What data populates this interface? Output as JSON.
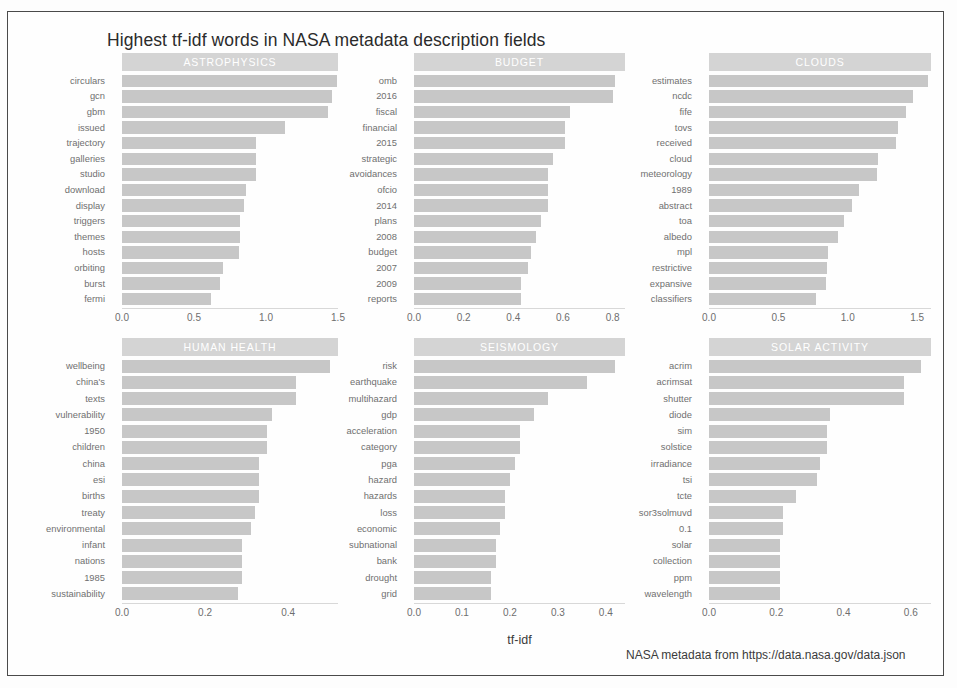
{
  "figure": {
    "title": "Highest tf-idf words in NASA metadata description fields",
    "xlabel": "tf-idf",
    "caption": "NASA metadata from https://data.nasa.gov/data.json"
  },
  "style": {
    "bar_color": "#c7c7c7",
    "strip_color": "#d4d4d4",
    "strip_text_color": "#ffffff",
    "axis_text_color": "#6e6e6e",
    "border_color": "#4a4a4a"
  },
  "chart_data": {
    "type": "bar",
    "title": "Highest tf-idf words in NASA metadata description fields",
    "xlabel": "tf-idf",
    "ylabel": "",
    "orientation": "horizontal",
    "grid": false,
    "legend": "none",
    "facets": [
      {
        "name": "ASTROPHYSICS",
        "xlim": [
          0.0,
          1.5
        ],
        "ticks": [
          "0.0",
          "0.5",
          "1.0",
          "1.5"
        ],
        "tick_values": [
          0.0,
          0.5,
          1.0,
          1.5
        ],
        "categories": [
          "circulars",
          "gcn",
          "gbm",
          "issued",
          "trajectory",
          "galleries",
          "studio",
          "download",
          "display",
          "triggers",
          "themes",
          "hosts",
          "orbiting",
          "burst",
          "fermi"
        ],
        "values": [
          1.49,
          1.46,
          1.43,
          1.13,
          0.93,
          0.93,
          0.93,
          0.86,
          0.85,
          0.82,
          0.82,
          0.81,
          0.7,
          0.68,
          0.62
        ]
      },
      {
        "name": "BUDGET",
        "xlim": [
          0.0,
          0.85
        ],
        "ticks": [
          "0.0",
          "0.2",
          "0.4",
          "0.6",
          "0.8"
        ],
        "tick_values": [
          0.0,
          0.2,
          0.4,
          0.6,
          0.8
        ],
        "categories": [
          "omb",
          "2016",
          "fiscal",
          "financial",
          "2015",
          "strategic",
          "avoidances",
          "ofcio",
          "2014",
          "plans",
          "2008",
          "budget",
          "2007",
          "2009",
          "reports"
        ],
        "values": [
          0.81,
          0.8,
          0.63,
          0.61,
          0.61,
          0.56,
          0.54,
          0.54,
          0.54,
          0.51,
          0.49,
          0.47,
          0.46,
          0.43,
          0.43
        ]
      },
      {
        "name": "CLOUDS",
        "xlim": [
          0.0,
          1.6
        ],
        "ticks": [
          "0.0",
          "0.5",
          "1.0",
          "1.5"
        ],
        "tick_values": [
          0.0,
          0.5,
          1.0,
          1.5
        ],
        "categories": [
          "estimates",
          "ncdc",
          "fife",
          "tovs",
          "received",
          "cloud",
          "meteorology",
          "1989",
          "abstract",
          "toa",
          "albedo",
          "mpl",
          "restrictive",
          "expansive",
          "classifiers"
        ],
        "values": [
          1.58,
          1.47,
          1.42,
          1.36,
          1.35,
          1.22,
          1.21,
          1.08,
          1.03,
          0.97,
          0.93,
          0.86,
          0.85,
          0.84,
          0.77
        ]
      },
      {
        "name": "HUMAN HEALTH",
        "xlim": [
          0.0,
          0.52
        ],
        "ticks": [
          "0.0",
          "0.2",
          "0.4"
        ],
        "tick_values": [
          0.0,
          0.2,
          0.4
        ],
        "categories": [
          "wellbeing",
          "china's",
          "texts",
          "vulnerability",
          "1950",
          "children",
          "china",
          "esi",
          "births",
          "treaty",
          "environmental",
          "infant",
          "nations",
          "1985",
          "sustainability"
        ],
        "values": [
          0.5,
          0.42,
          0.42,
          0.36,
          0.35,
          0.35,
          0.33,
          0.33,
          0.33,
          0.32,
          0.31,
          0.29,
          0.29,
          0.29,
          0.28
        ]
      },
      {
        "name": "SEISMOLOGY",
        "xlim": [
          0.0,
          0.44
        ],
        "ticks": [
          "0.0",
          "0.1",
          "0.2",
          "0.3",
          "0.4"
        ],
        "tick_values": [
          0.0,
          0.1,
          0.2,
          0.3,
          0.4
        ],
        "categories": [
          "risk",
          "earthquake",
          "multihazard",
          "gdp",
          "acceleration",
          "category",
          "pga",
          "hazard",
          "hazards",
          "loss",
          "economic",
          "subnational",
          "bank",
          "drought",
          "grid"
        ],
        "values": [
          0.42,
          0.36,
          0.28,
          0.25,
          0.22,
          0.22,
          0.21,
          0.2,
          0.19,
          0.19,
          0.18,
          0.17,
          0.17,
          0.16,
          0.16
        ]
      },
      {
        "name": "SOLAR ACTIVITY",
        "xlim": [
          0.0,
          0.66
        ],
        "ticks": [
          "0.0",
          "0.2",
          "0.4",
          "0.6"
        ],
        "tick_values": [
          0.0,
          0.2,
          0.4,
          0.6
        ],
        "categories": [
          "acrim",
          "acrimsat",
          "shutter",
          "diode",
          "sim",
          "solstice",
          "irradiance",
          "tsi",
          "tcte",
          "sor3solmuvd",
          "0.1",
          "solar",
          "collection",
          "ppm",
          "wavelength"
        ],
        "values": [
          0.63,
          0.58,
          0.58,
          0.36,
          0.35,
          0.35,
          0.33,
          0.32,
          0.26,
          0.22,
          0.22,
          0.21,
          0.21,
          0.21,
          0.21
        ]
      }
    ]
  }
}
